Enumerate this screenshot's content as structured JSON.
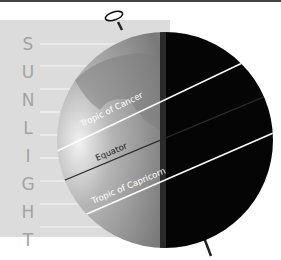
{
  "diagram": {
    "sunlight_label": [
      "S",
      "U",
      "N",
      "L",
      "I",
      "G",
      "H",
      "T"
    ],
    "lines": [
      {
        "label": "Tropic of Cancer"
      },
      {
        "label": "Equator"
      },
      {
        "label": "Tropic of Capricorn"
      }
    ],
    "colors": {
      "sunlight_band": "#dcdcdc",
      "letters": "#a3a3a3",
      "day_side": "#8a8a8a",
      "night_side": "#050505",
      "tropic_line": "#ffffff",
      "equator_line": "#333333"
    }
  }
}
